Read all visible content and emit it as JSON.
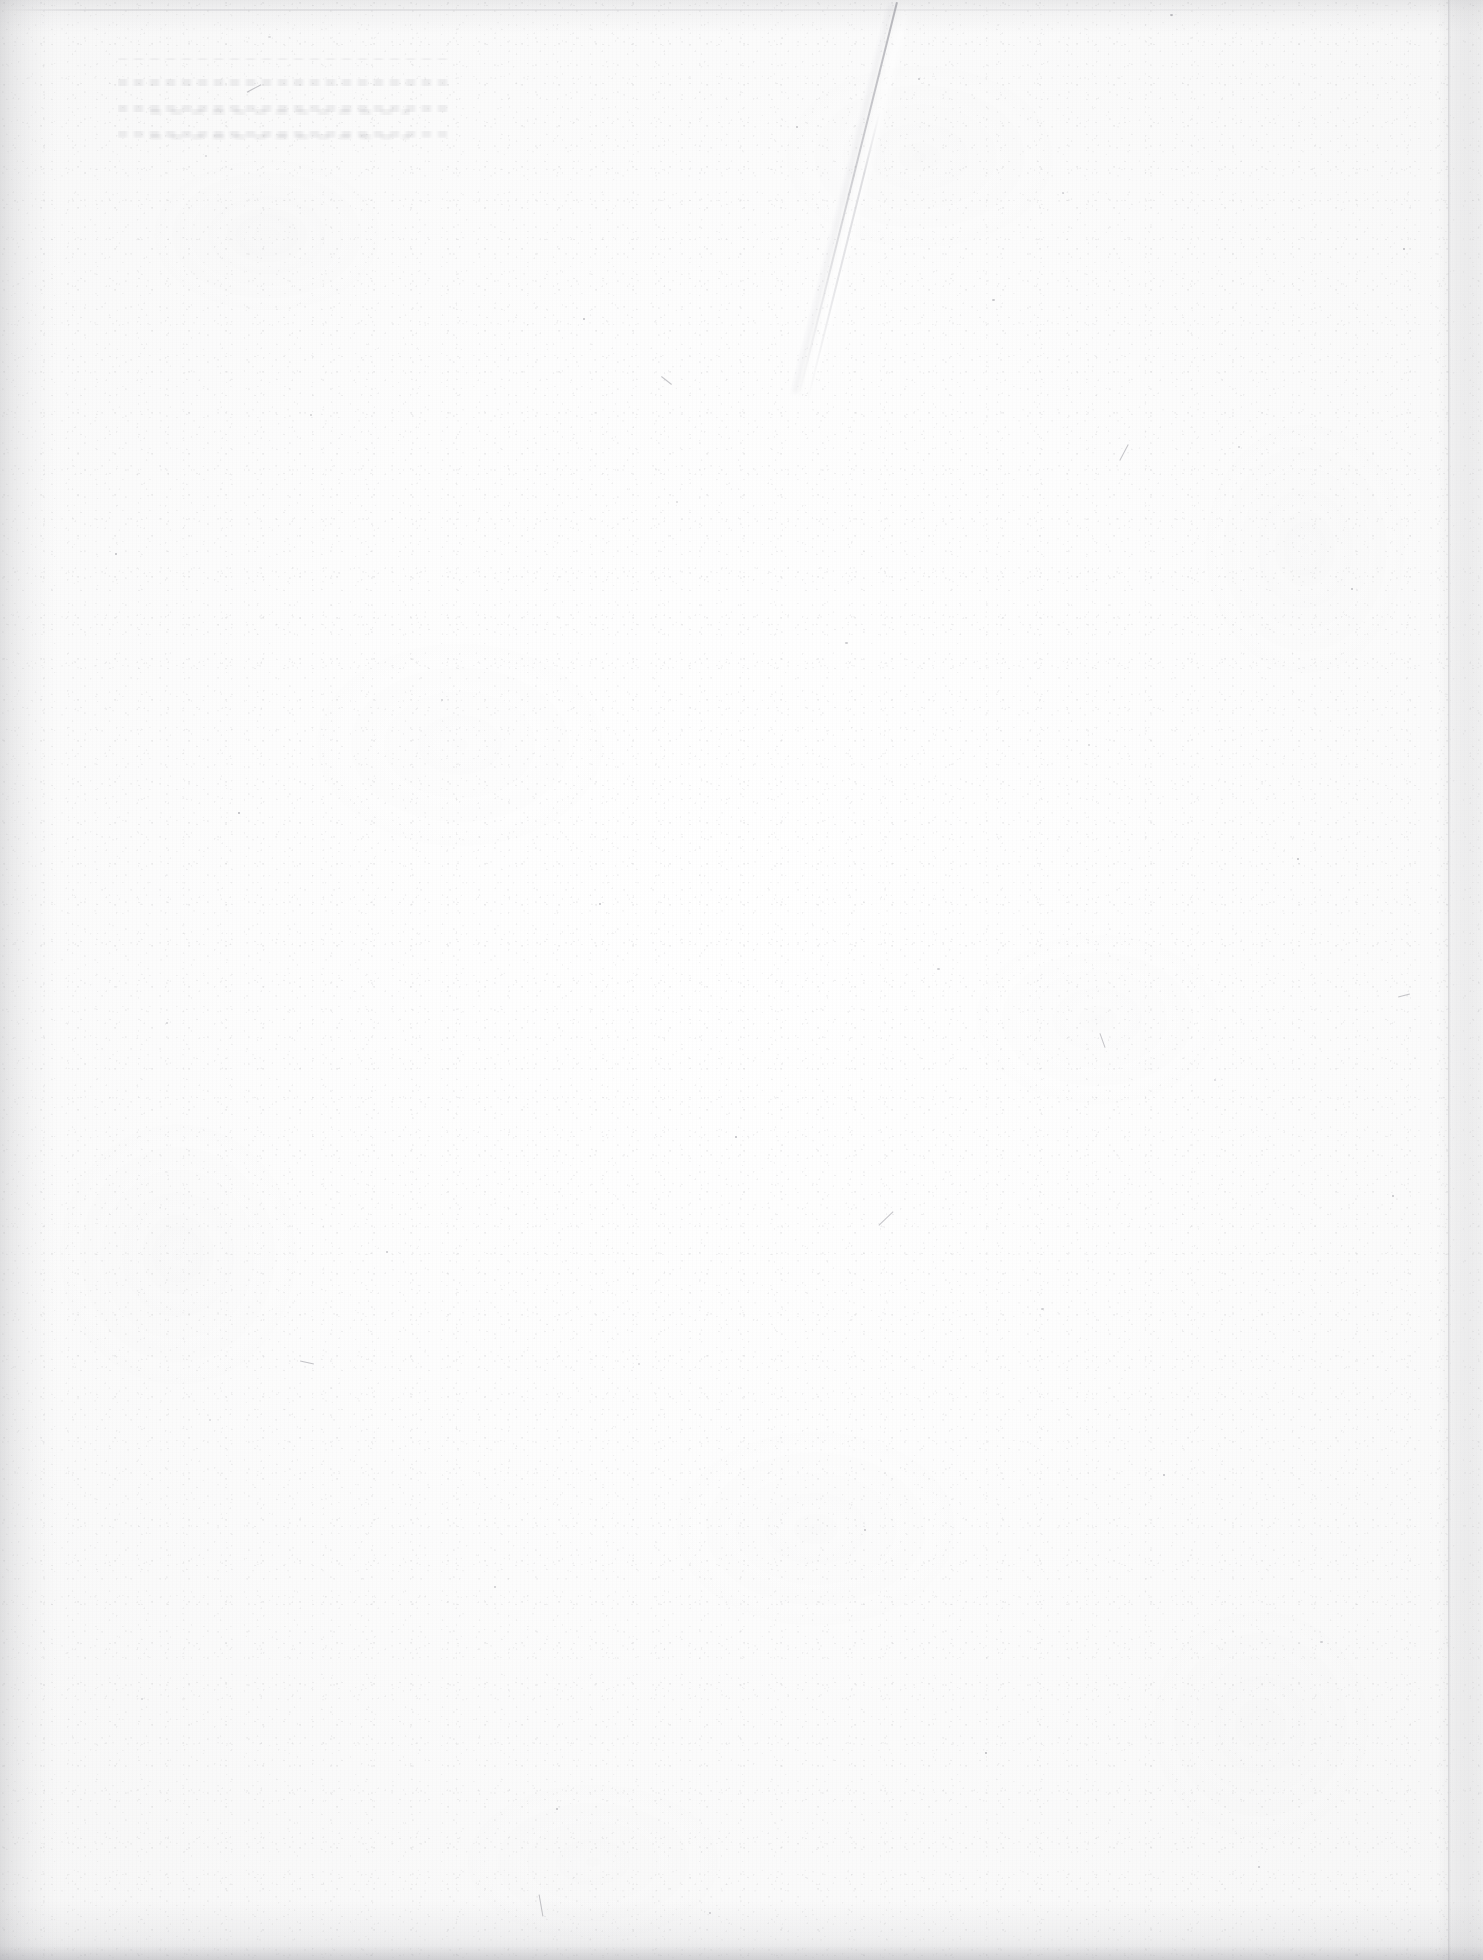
{
  "document": {
    "kind": "scanned-book-page",
    "side": "verso",
    "content_state": "blank",
    "visible_text": "",
    "page_number": "",
    "caption": "",
    "notes": ""
  },
  "canvas": {
    "width_px": 1483,
    "height_px": 1960
  },
  "colors": {
    "paper_center": "#ffffff",
    "paper_mid": "#fdfdfd",
    "paper_outer": "#f6f6f6",
    "page_background": "#fcfcfc",
    "edge_shadow": "#96969b",
    "crease_line": "#787882",
    "speck": "#5f5f69"
  },
  "artifacts": {
    "crease": {
      "name": "diagonal-crease",
      "from_x": 896,
      "from_y": 2,
      "to_x": 796,
      "to_y": 402,
      "angle_deg": 14
    },
    "edges": [
      {
        "name": "left-edge-shadow",
        "width_px": 58
      },
      {
        "name": "right-edge-shadow",
        "width_px": 46,
        "seam_x": 1448
      },
      {
        "name": "top-edge-shadow",
        "height_px": 34,
        "hairline_y": 9
      },
      {
        "name": "bottom-edge-shadow",
        "height_px": 60,
        "band_height_px": 14
      }
    ],
    "showthrough": {
      "name": "reverse-side-ghost-text",
      "x": 118,
      "y": 58,
      "width": 330,
      "height": 80,
      "legible": false
    },
    "specks": [
      {
        "x": 268,
        "y": 36,
        "w": 3,
        "h": 2
      },
      {
        "x": 1170,
        "y": 14,
        "w": 2.5,
        "h": 2
      },
      {
        "x": 796,
        "y": 126,
        "w": 2,
        "h": 2
      },
      {
        "x": 918,
        "y": 78,
        "w": 2,
        "h": 1.5
      },
      {
        "x": 1062,
        "y": 192,
        "w": 2,
        "h": 2
      },
      {
        "x": 205,
        "y": 155,
        "w": 2,
        "h": 1.5
      },
      {
        "x": 1403,
        "y": 248,
        "w": 2,
        "h": 2
      },
      {
        "x": 583,
        "y": 318,
        "w": 2,
        "h": 1.5
      },
      {
        "x": 992,
        "y": 299,
        "w": 2.5,
        "h": 2
      },
      {
        "x": 310,
        "y": 414,
        "w": 2,
        "h": 2
      },
      {
        "x": 1238,
        "y": 446,
        "w": 2,
        "h": 1.5
      },
      {
        "x": 676,
        "y": 501,
        "w": 2,
        "h": 2
      },
      {
        "x": 115,
        "y": 553,
        "w": 2,
        "h": 2
      },
      {
        "x": 1351,
        "y": 588,
        "w": 2,
        "h": 1.5
      },
      {
        "x": 845,
        "y": 642,
        "w": 2.5,
        "h": 2
      },
      {
        "x": 441,
        "y": 699,
        "w": 2,
        "h": 2
      },
      {
        "x": 1088,
        "y": 744,
        "w": 2,
        "h": 1.5
      },
      {
        "x": 238,
        "y": 812,
        "w": 2,
        "h": 2
      },
      {
        "x": 1297,
        "y": 858,
        "w": 2,
        "h": 2
      },
      {
        "x": 599,
        "y": 903,
        "w": 2,
        "h": 1.5
      },
      {
        "x": 937,
        "y": 968,
        "w": 2.5,
        "h": 2
      },
      {
        "x": 166,
        "y": 1022,
        "w": 2,
        "h": 2
      },
      {
        "x": 1214,
        "y": 1079,
        "w": 2,
        "h": 1.5
      },
      {
        "x": 735,
        "y": 1136,
        "w": 2,
        "h": 2
      },
      {
        "x": 1392,
        "y": 1195,
        "w": 2,
        "h": 2
      },
      {
        "x": 386,
        "y": 1251,
        "w": 2,
        "h": 1.5
      },
      {
        "x": 1041,
        "y": 1308,
        "w": 2.5,
        "h": 2
      },
      {
        "x": 638,
        "y": 1363,
        "w": 2,
        "h": 2
      },
      {
        "x": 209,
        "y": 1419,
        "w": 2,
        "h": 1.5
      },
      {
        "x": 1163,
        "y": 1474,
        "w": 2,
        "h": 2
      },
      {
        "x": 864,
        "y": 1529,
        "w": 2,
        "h": 2
      },
      {
        "x": 494,
        "y": 1586,
        "w": 2,
        "h": 1.5
      },
      {
        "x": 1320,
        "y": 1641,
        "w": 2.5,
        "h": 2
      },
      {
        "x": 141,
        "y": 1698,
        "w": 2,
        "h": 2
      },
      {
        "x": 985,
        "y": 1752,
        "w": 2,
        "h": 1.5
      },
      {
        "x": 556,
        "y": 1808,
        "w": 2,
        "h": 2
      },
      {
        "x": 1258,
        "y": 1866,
        "w": 2,
        "h": 2
      },
      {
        "x": 709,
        "y": 1912,
        "w": 2,
        "h": 1.5
      }
    ],
    "fibers": [
      {
        "x": 246,
        "y": 88,
        "len": 16,
        "thick": 1,
        "rot": -28
      },
      {
        "x": 660,
        "y": 380,
        "len": 13,
        "thick": 1,
        "rot": 38
      },
      {
        "x": 1115,
        "y": 452,
        "len": 18,
        "thick": 1,
        "rot": -62
      },
      {
        "x": 300,
        "y": 1362,
        "len": 14,
        "thick": 1,
        "rot": 12
      },
      {
        "x": 876,
        "y": 1218,
        "len": 20,
        "thick": 1,
        "rot": -44
      },
      {
        "x": 1095,
        "y": 1040,
        "len": 15,
        "thick": 1,
        "rot": 70
      },
      {
        "x": 530,
        "y": 1905,
        "len": 22,
        "thick": 1,
        "rot": 80
      },
      {
        "x": 1398,
        "y": 995,
        "len": 12,
        "thick": 1,
        "rot": -15
      }
    ]
  }
}
